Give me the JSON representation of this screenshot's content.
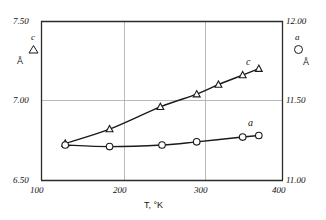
{
  "chart_data": {
    "type": "line",
    "title": "",
    "xlabel": "T, °K",
    "xlim": [
      100,
      400
    ],
    "xticks": [
      100,
      200,
      300,
      400
    ],
    "xtick_labels": [
      "100",
      "200",
      "300",
      "400"
    ],
    "grid": true,
    "grid_axes": "both",
    "axes": [
      {
        "id": "left",
        "symbol": "c",
        "unit": "Å",
        "marker": "triangle",
        "ylim": [
          6.5,
          7.5
        ],
        "yticks": [
          6.5,
          7.0,
          7.5
        ],
        "ytick_labels": [
          "6.50",
          "7.00",
          "7.50"
        ]
      },
      {
        "id": "right",
        "symbol": "a",
        "unit": "Å",
        "marker": "circle",
        "ylim": [
          11.0,
          12.0
        ],
        "yticks": [
          11.0,
          11.5,
          12.0
        ],
        "ytick_labels": [
          "11.00",
          "11.50",
          "12.00"
        ]
      }
    ],
    "series": [
      {
        "name": "c",
        "axis": "left",
        "marker": "triangle",
        "label": "c",
        "x": [
          130,
          185,
          248,
          293,
          320,
          350,
          370
        ],
        "values": [
          6.73,
          6.82,
          6.96,
          7.04,
          7.1,
          7.16,
          7.2
        ]
      },
      {
        "name": "a",
        "axis": "right",
        "marker": "circle",
        "label": "a",
        "x": [
          130,
          185,
          250,
          293,
          350,
          370
        ],
        "values": [
          11.22,
          11.21,
          11.22,
          11.24,
          11.27,
          11.28
        ]
      }
    ],
    "legend": {
      "position": "inside-top-corners",
      "left": {
        "symbol": "c",
        "marker": "triangle",
        "unit": "Å"
      },
      "right": {
        "symbol": "a",
        "marker": "circle",
        "unit": "Å"
      }
    },
    "colors": {
      "line": "#1a1a1a",
      "axis": "#333333",
      "grid": "#999999",
      "marker_fill": "#ffffff",
      "background": "#ffffff"
    }
  },
  "labels": {
    "x_axis_title": "T, °K",
    "left_unit": "Å",
    "right_unit": "Å",
    "left_symbol": "c",
    "right_symbol": "a",
    "curve_c": "c",
    "curve_a": "a",
    "ytick_left_top": "7.50",
    "ytick_left_mid": "7.00",
    "ytick_left_bottom": "6.50",
    "ytick_right_top": "12.00",
    "ytick_right_mid": "11.50",
    "ytick_right_bottom": "11.00",
    "xtick_1": "100",
    "xtick_2": "200",
    "xtick_3": "300",
    "xtick_4": "400"
  }
}
